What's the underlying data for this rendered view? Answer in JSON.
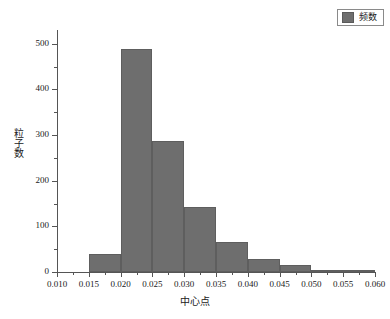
{
  "legend": {
    "position": "top-right",
    "entries": [
      {
        "label": "频数",
        "swatch_name": "frequency-swatch",
        "color": "#6e6e6e"
      }
    ]
  },
  "axes": {
    "x_title": "中心点",
    "y_title": "粒子数",
    "x_ticks": [
      "0.010",
      "0.015",
      "0.020",
      "0.025",
      "0.030",
      "0.035",
      "0.040",
      "0.045",
      "0.050",
      "0.055",
      "0.060"
    ],
    "y_ticks": [
      "0",
      "100",
      "200",
      "300",
      "400",
      "500"
    ]
  },
  "colors": {
    "bar_fill": "#6e6e6e",
    "bar_edge": "#5e5e5e",
    "axis": "#555555",
    "text": "#1a1a1a",
    "background": "#ffffff"
  },
  "chart_data": {
    "type": "bar",
    "title": "",
    "subtitle": "",
    "xlabel": "中心点",
    "ylabel": "粒子数",
    "xlim": [
      0.01,
      0.06
    ],
    "ylim": [
      0,
      530
    ],
    "grid": false,
    "legend_position": "top-right",
    "bin_width": 0.005,
    "categories": [
      "0.0175",
      "0.0225",
      "0.0275",
      "0.0325",
      "0.0375",
      "0.0425",
      "0.0475",
      "0.0525",
      "0.0575"
    ],
    "bin_edges": [
      0.015,
      0.02,
      0.025,
      0.03,
      0.035,
      0.04,
      0.045,
      0.05,
      0.055,
      0.06
    ],
    "values": [
      40,
      488,
      287,
      142,
      66,
      28,
      16,
      4,
      5
    ],
    "series": [
      {
        "name": "频数",
        "values": [
          40,
          488,
          287,
          142,
          66,
          28,
          16,
          4,
          5
        ]
      }
    ],
    "annotations": []
  }
}
